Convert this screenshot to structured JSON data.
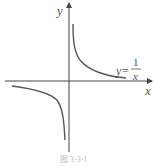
{
  "figure": {
    "y_axis_label": "y",
    "x_axis_label": "x",
    "function_lhs": "y=",
    "function_numerator": "1",
    "function_denominator": "x",
    "caption": "图 3-3-1",
    "curve_color": "#555555",
    "axis_color": "#444444"
  }
}
